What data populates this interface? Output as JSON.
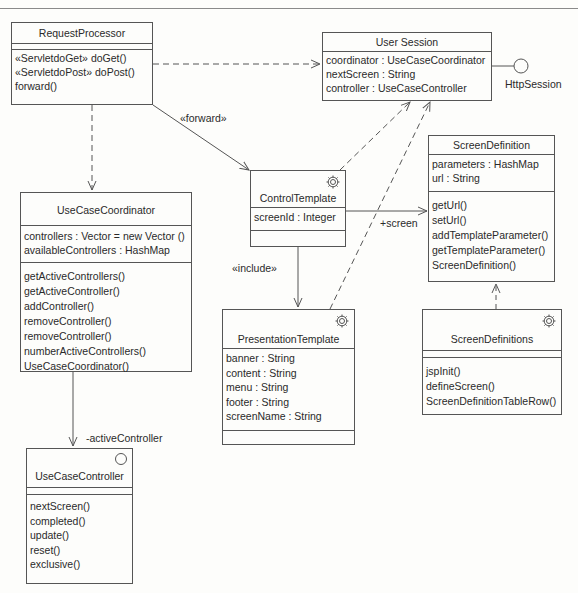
{
  "classes": {
    "request_processor": {
      "name": "RequestProcessor",
      "attributes": [],
      "operations": [
        "«ServletdoGet» doGet()",
        "«ServletdoPost» doPost()",
        "forward()"
      ]
    },
    "user_session": {
      "name": "User Session",
      "attributes": [
        "coordinator : UseCaseCoordinator",
        "nextScreen : String",
        "controller : UseCaseController"
      ]
    },
    "use_case_coordinator": {
      "name": "UseCaseCoordinator",
      "attributes": [
        "controllers : Vector = new Vector ()",
        "availableControllers : HashMap"
      ],
      "operations": [
        "getActiveControllers()",
        "getActiveController()",
        "addController()",
        "removeController()",
        "removeController()",
        "numberActiveControllers()",
        "UseCaseCoordinator()"
      ]
    },
    "use_case_controller": {
      "name": "UseCaseController",
      "icon": "circle-icon",
      "operations": [
        "nextScreen()",
        "completed()",
        "update()",
        "reset()",
        "exclusive()"
      ]
    },
    "control_template": {
      "name": "ControlTemplate",
      "icon": "gear-icon",
      "attributes": [
        "screenId : Integer"
      ]
    },
    "presentation_template": {
      "name": "PresentationTemplate",
      "icon": "gear-icon",
      "attributes": [
        "banner : String",
        "content : String",
        "menu : String",
        "footer : String",
        "screenName : String"
      ]
    },
    "screen_definition": {
      "name": "ScreenDefinition",
      "attributes": [
        "parameters : HashMap",
        "url : String"
      ],
      "operations": [
        "getUrl()",
        "setUrl()",
        "addTemplateParameter()",
        "getTemplateParameter()",
        "ScreenDefinition()"
      ]
    },
    "screen_definitions": {
      "name": "ScreenDefinitions",
      "icon": "gear-icon",
      "operations": [
        "jspInit()",
        "defineScreen()",
        "ScreenDefinitionTableRow()"
      ]
    }
  },
  "interface": {
    "name": "HttpSession"
  },
  "labels": {
    "forward": "«forward»",
    "include": "«include»",
    "screen": "+screen",
    "active_controller": "-activeController"
  }
}
